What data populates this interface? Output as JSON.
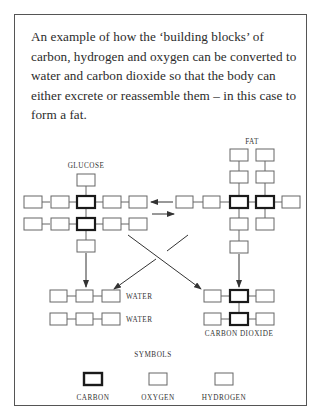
{
  "caption": "An example of how the ‘building blocks’ of carbon, hydrogen and oxygen can be converted to water and carbon dioxide so that the body can either excrete or reassemble them – in this case to form a fat.",
  "molecules": {
    "glucose": {
      "label": "GLUCOSE"
    },
    "fat": {
      "label": "FAT"
    },
    "water_1": {
      "label": "WATER"
    },
    "water_2": {
      "label": "WATER"
    },
    "carbon_dioxide": {
      "label": "CARBON DIOXIDE"
    }
  },
  "legend": {
    "title": "SYMBOLS",
    "items": [
      {
        "label": "CARBON",
        "symbol": "thick-outlined-square"
      },
      {
        "label": "OXYGEN",
        "symbol": "thin-outlined-square"
      },
      {
        "label": "HYDROGEN",
        "symbol": "thin-outlined-square"
      }
    ]
  },
  "colors": {
    "stroke": "#555555",
    "carbon_stroke": "#1a1a1a",
    "text": "#2b2b2b"
  }
}
